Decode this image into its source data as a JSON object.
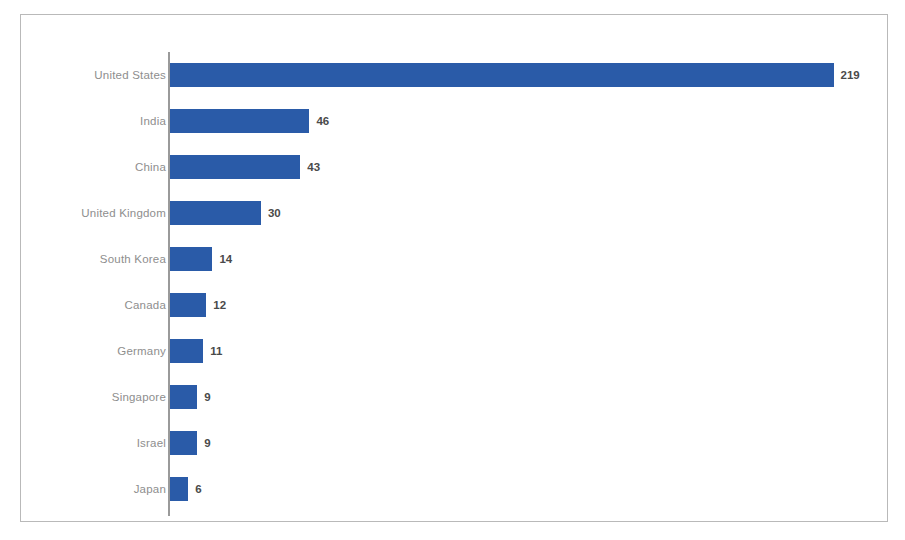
{
  "chart_data": {
    "type": "bar",
    "orientation": "horizontal",
    "title": "",
    "subtitle": "",
    "xlabel": "",
    "ylabel": "",
    "categories": [
      "United States",
      "India",
      "China",
      "United Kingdom",
      "South Korea",
      "Canada",
      "Germany",
      "Singapore",
      "Israel",
      "Japan"
    ],
    "values": [
      219,
      46,
      43,
      30,
      14,
      12,
      11,
      9,
      9,
      6
    ],
    "value_labels": [
      "219",
      "46",
      "43",
      "30",
      "14",
      "12",
      "11",
      "9",
      "9",
      "6"
    ],
    "xlim": [
      0,
      233
    ],
    "grid": false,
    "legend": null,
    "bar_color": "#2a5ba8",
    "label_color": "#8e8e8e",
    "value_label_color": "#4a4a4a",
    "axis_line_color": "#9a9a9a",
    "frame_color": "#b9b9b9",
    "background": "#ffffff"
  },
  "footnote": {
    "text": ""
  }
}
